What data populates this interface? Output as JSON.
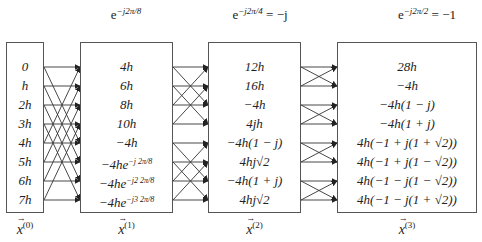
{
  "twiddles": [
    {
      "base": "e",
      "exponent": "−j2π/8",
      "rhs": ""
    },
    {
      "base": "e",
      "exponent": "−j2π/4",
      "rhs": " = −j"
    },
    {
      "base": "e",
      "exponent": "−j2π/2",
      "rhs": " = −1"
    }
  ],
  "stages": [
    {
      "label": "x",
      "superscript": "(0)",
      "values": [
        "0",
        "h",
        "2h",
        "3h",
        "4h",
        "5h",
        "6h",
        "7h"
      ]
    },
    {
      "label": "x",
      "superscript": "(1)",
      "values": [
        "4h",
        "6h",
        "8h",
        "10h",
        "−4h",
        "−4he⁻ʲ²π/⁸",
        "−4he⁻ʲ²·²π/⁸",
        "−4he⁻ʲ³·²π/⁸"
      ]
    },
    {
      "label": "x",
      "superscript": "(2)",
      "values": [
        "12h",
        "16h",
        "−4h",
        "4jh",
        "−4h(1 − j)",
        "4hj√2",
        "−4h(1 + j)",
        "4hj√2"
      ]
    },
    {
      "label": "x",
      "superscript": "(3)",
      "values": [
        "28h",
        "−4h",
        "−4h(1 − j)",
        "−4h(1 + j)",
        "4h(−1 + j(1 + √2))",
        "4h(−1 + j(1 − √2))",
        "4h(−1 − j(1 − √2))",
        "4h(−1 − j(1 + √2))"
      ]
    }
  ],
  "stage1_display": [
    "4h",
    "6h",
    "8h",
    "10h",
    "−4h",
    "−4he",
    "−4he",
    "−4he"
  ],
  "stage1_exps": [
    "",
    "",
    "",
    "",
    "",
    "−j 2π/8",
    "−j2 2π/8",
    "−j3 2π/8"
  ],
  "butterfly": {
    "stage_spans": [
      4,
      2,
      1
    ],
    "line_color": "#333333"
  }
}
